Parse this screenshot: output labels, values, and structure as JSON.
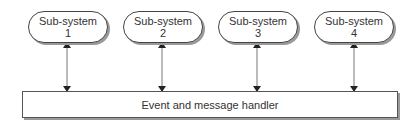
{
  "diagram": {
    "subsystems": [
      {
        "line1": "Sub-system",
        "line2": "1"
      },
      {
        "line1": "Sub-system",
        "line2": "2"
      },
      {
        "line1": "Sub-system",
        "line2": "3"
      },
      {
        "line1": "Sub-system",
        "line2": "4"
      }
    ],
    "handler": {
      "label": "Event and message handler"
    },
    "connections": [
      {
        "from": "Sub-system 1",
        "to": "Event and message handler",
        "direction": "bidirectional"
      },
      {
        "from": "Sub-system 2",
        "to": "Event and message handler",
        "direction": "bidirectional"
      },
      {
        "from": "Sub-system 3",
        "to": "Event and message handler",
        "direction": "bidirectional"
      },
      {
        "from": "Sub-system 4",
        "to": "Event and message handler",
        "direction": "bidirectional"
      }
    ]
  }
}
